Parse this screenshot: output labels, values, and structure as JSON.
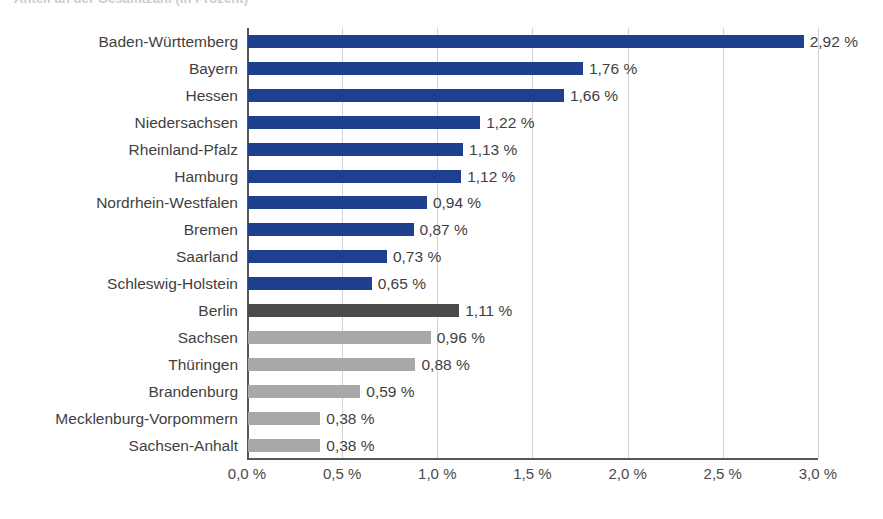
{
  "title": {
    "text": "Anteil an der Gesamtzahl (in Prozent)"
  },
  "chart_data": {
    "type": "bar",
    "orientation": "horizontal",
    "title": "Anteil an der Gesamtzahl (in Prozent)",
    "xlabel": "",
    "ylabel": "",
    "xlim": [
      0,
      3.0
    ],
    "grid": true,
    "legend": "none",
    "value_suffix": " %",
    "decimal_separator": ",",
    "xticks": [
      "0,0 %",
      "0,5 %",
      "1,0 %",
      "1,5 %",
      "2,0 %",
      "2,5 %",
      "3,0 %"
    ],
    "xtick_values": [
      0,
      0.5,
      1.0,
      1.5,
      2.0,
      2.5,
      3.0
    ],
    "categories": [
      "Baden-Württemberg",
      "Bayern",
      "Hessen",
      "Niedersachsen",
      "Rheinland-Pfalz",
      "Hamburg",
      "Nordrhein-Westfalen",
      "Bremen",
      "Saarland",
      "Schleswig-Holstein",
      "Berlin",
      "Sachsen",
      "Thüringen",
      "Brandenburg",
      "Mecklenburg-Vorpommern",
      "Sachsen-Anhalt"
    ],
    "values": [
      2.92,
      1.76,
      1.66,
      1.22,
      1.13,
      1.12,
      0.94,
      0.87,
      0.73,
      0.65,
      1.11,
      0.96,
      0.88,
      0.59,
      0.38,
      0.38
    ],
    "value_labels": [
      "2,92 %",
      "1,76 %",
      "1,66 %",
      "1,22 %",
      "1,13 %",
      "1,12 %",
      "0,94 %",
      "0,87 %",
      "0,73 %",
      "0,65 %",
      "1,11 %",
      "0,96 %",
      "0,88 %",
      "0,59 %",
      "0,38 %",
      "0,38 %"
    ],
    "bar_colors": [
      "#1f3f8f",
      "#1f3f8f",
      "#1f3f8f",
      "#1f3f8f",
      "#1f3f8f",
      "#1f3f8f",
      "#1f3f8f",
      "#1f3f8f",
      "#1f3f8f",
      "#1f3f8f",
      "#4a4a4a",
      "#a8a8a8",
      "#a8a8a8",
      "#a8a8a8",
      "#a8a8a8",
      "#a8a8a8"
    ],
    "colors": {
      "west": "#1f3f8f",
      "berlin": "#4a4a4a",
      "east": "#a8a8a8",
      "axis": "#58585a",
      "grid": "#d3d3d5",
      "text": "#3f3f41",
      "background": "#ffffff"
    }
  }
}
